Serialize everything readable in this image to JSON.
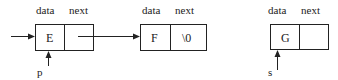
{
  "diagram": {
    "type": "linked-list",
    "nodes": [
      {
        "id": "E",
        "field_labels": [
          "data",
          "next"
        ],
        "data": "E",
        "next": "",
        "pointer": "p"
      },
      {
        "id": "F",
        "field_labels": [
          "data",
          "next"
        ],
        "data": "F",
        "next": "\\0",
        "pointer": ""
      },
      {
        "id": "G",
        "field_labels": [
          "data",
          "next"
        ],
        "data": "G",
        "next": "",
        "pointer": "s"
      }
    ],
    "edges": [
      {
        "from": "head",
        "to": "E"
      },
      {
        "from": "E.next",
        "to": "F"
      }
    ]
  },
  "labels": {
    "n1_data_hdr": "data",
    "n1_next_hdr": "next",
    "n1_data": "E",
    "n1_next": "",
    "n1_ptr": "p",
    "n2_data_hdr": "data",
    "n2_next_hdr": "next",
    "n2_data": "F",
    "n2_next": "\\0",
    "n3_data_hdr": "data",
    "n3_next_hdr": "next",
    "n3_data": "G",
    "n3_next": "",
    "n3_ptr": "s"
  }
}
